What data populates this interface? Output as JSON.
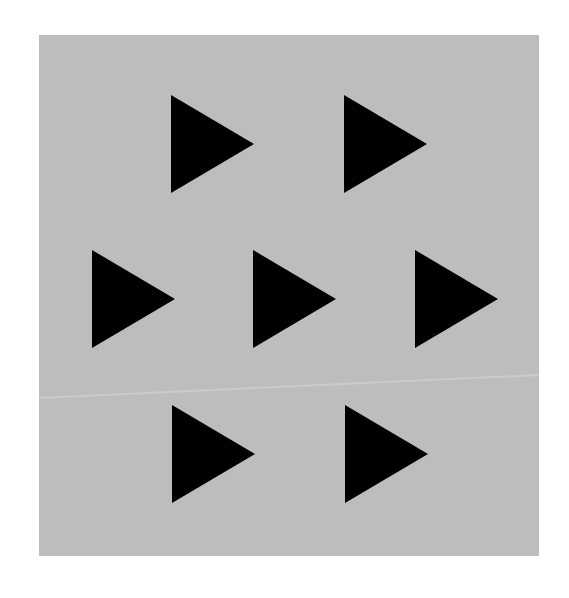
{
  "panel": {
    "x": 39,
    "y": 35,
    "width": 500,
    "height": 521,
    "color": "#bdbdbd"
  },
  "shape": {
    "type": "right-pointing-triangle",
    "color": "#000000",
    "width": 83,
    "height": 99
  },
  "rows": [
    {
      "count": 2,
      "top": 95,
      "lefts": [
        171,
        344
      ]
    },
    {
      "count": 3,
      "top": 250,
      "lefts": [
        92,
        253,
        415
      ]
    },
    {
      "count": 2,
      "top": 405,
      "lefts": [
        172,
        345
      ]
    }
  ],
  "total_triangles": 7,
  "seam": {
    "description": "faint lighter crease line",
    "y_left": 398,
    "y_right": 375
  }
}
